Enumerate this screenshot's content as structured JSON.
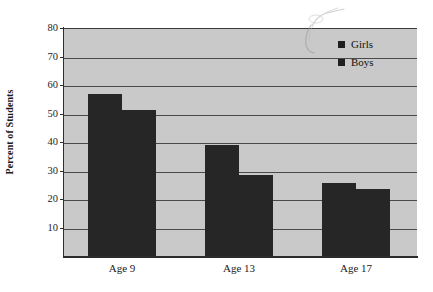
{
  "chart_data": {
    "type": "bar",
    "title": "",
    "subtitle": "",
    "xlabel": "",
    "ylabel": "Percent of Students",
    "categories": [
      "Age 9",
      "Age 13",
      "Age 17"
    ],
    "series": [
      {
        "name": "Girls",
        "values": [
          57,
          39,
          25.5
        ]
      },
      {
        "name": "Boys",
        "values": [
          51.3,
          28.5,
          23.5
        ]
      }
    ],
    "ylim": [
      0,
      80
    ],
    "yticks": [
      10,
      20,
      30,
      40,
      50,
      60,
      70,
      80
    ],
    "ytick_labels": [
      "10",
      "20",
      "30",
      "40",
      "50",
      "60",
      "70",
      "80"
    ],
    "grid": true,
    "legend_position": "top-right",
    "legend_entries": [
      "Girls",
      "Boys"
    ],
    "bar_color": "#262626",
    "plot_background": "#c9c9c9",
    "page_background": "#ffffff",
    "gridline_color": "#4a4a4a",
    "axis_color": "#2b2b2b"
  },
  "axis": {
    "y_title": "Percent of Students"
  },
  "legend": {
    "items": [
      {
        "label": "Girls",
        "swatch_color": "#1f1f1f"
      },
      {
        "label": "Boys",
        "swatch_color": "#1f1f1f"
      }
    ]
  },
  "artifact": {
    "name": "scan-smudge",
    "description": ""
  }
}
